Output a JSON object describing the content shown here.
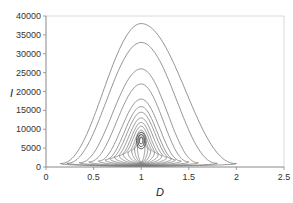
{
  "chart_data": {
    "type": "line",
    "title": "",
    "xlabel": "D",
    "ylabel": "I",
    "xlim": [
      0,
      2.5
    ],
    "ylim": [
      0,
      40000
    ],
    "x_ticks": [
      "0",
      "0.5",
      "1",
      "1.5",
      "2",
      "2.5"
    ],
    "y_ticks": [
      "0",
      "5000",
      "10000",
      "15000",
      "20000",
      "25000",
      "30000",
      "35000",
      "40000"
    ],
    "grid": false,
    "legend": "none",
    "series": [
      {
        "name": "orbit-1",
        "peak_I": 38000,
        "D_min": 0.15,
        "D_max": 2.0
      },
      {
        "name": "orbit-2",
        "peak_I": 33000,
        "D_min": 0.22,
        "D_max": 1.8
      },
      {
        "name": "orbit-3",
        "peak_I": 26000,
        "D_min": 0.35,
        "D_max": 1.6
      },
      {
        "name": "orbit-4",
        "peak_I": 22000,
        "D_min": 0.45,
        "D_max": 1.5
      },
      {
        "name": "orbit-5",
        "peak_I": 18000,
        "D_min": 0.55,
        "D_max": 1.42
      },
      {
        "name": "orbit-6",
        "peak_I": 16000,
        "D_min": 0.62,
        "D_max": 1.36
      },
      {
        "name": "orbit-7",
        "peak_I": 14500,
        "D_min": 0.67,
        "D_max": 1.32
      },
      {
        "name": "orbit-8",
        "peak_I": 13000,
        "D_min": 0.72,
        "D_max": 1.27
      },
      {
        "name": "orbit-9",
        "peak_I": 11800,
        "D_min": 0.77,
        "D_max": 1.22
      },
      {
        "name": "orbit-10",
        "peak_I": 10800,
        "D_min": 0.81,
        "D_max": 1.18
      },
      {
        "name": "orbit-11",
        "peak_I": 9800,
        "D_min": 0.86,
        "D_max": 1.14
      },
      {
        "name": "orbit-12",
        "peak_I": 9200,
        "D_min": 0.9,
        "D_max": 1.1
      },
      {
        "name": "orbit-13",
        "peak_I": 8600,
        "D_min": 0.93,
        "D_max": 1.07
      },
      {
        "name": "orbit-14",
        "peak_I": 8000,
        "D_min": 0.96,
        "D_max": 1.04
      }
    ],
    "equilibrium": {
      "D": 1.0,
      "I": 7000
    }
  },
  "colors": {
    "line": "#7a7a7a",
    "axis": "#888888"
  }
}
